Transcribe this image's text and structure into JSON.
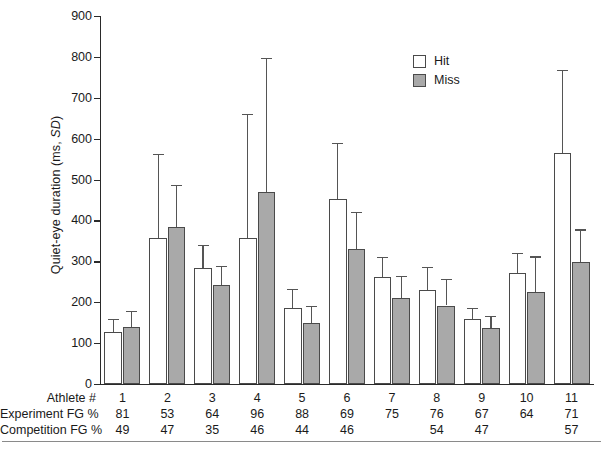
{
  "chart_data": {
    "type": "bar",
    "title": "",
    "xlabel": "Athlete #",
    "ylabel": "Quiet-eye duration (ms, SD)",
    "ylim": [
      0,
      900
    ],
    "yticks": [
      0,
      100,
      200,
      300,
      400,
      500,
      600,
      700,
      800,
      900
    ],
    "grid": false,
    "legend_position": "top-right",
    "categories": [
      "1",
      "2",
      "3",
      "4",
      "5",
      "6",
      "7",
      "8",
      "9",
      "10",
      "11"
    ],
    "series": [
      {
        "name": "Hit",
        "color": "#ffffff",
        "values": [
          127,
          358,
          283,
          357,
          187,
          452,
          261,
          229,
          158,
          271,
          565
        ],
        "error_upper": [
          160,
          563,
          340,
          660,
          232,
          590,
          310,
          287,
          187,
          320,
          768
        ]
      },
      {
        "name": "Miss",
        "color": "#a9a9a9",
        "values": [
          139,
          385,
          241,
          469,
          150,
          330,
          211,
          192,
          137,
          224,
          298
        ],
        "error_upper": [
          178,
          487,
          289,
          798,
          190,
          420,
          265,
          258,
          167,
          312,
          378
        ]
      }
    ]
  },
  "legend": {
    "items": [
      {
        "label": "Hit",
        "swatch": "white"
      },
      {
        "label": "Miss",
        "swatch": "gray"
      }
    ]
  },
  "axis": {
    "y_title_main": "Quiet-eye duration (ms, ",
    "y_title_italic": "SD",
    "y_title_close": ")",
    "y_tick_labels": [
      "900",
      "800",
      "700",
      "600",
      "500",
      "400",
      "300",
      "200",
      "100",
      "0"
    ]
  },
  "table": {
    "rows": [
      {
        "header": "Athlete #",
        "values": [
          "1",
          "2",
          "3",
          "4",
          "5",
          "6",
          "7",
          "8",
          "9",
          "10",
          "11"
        ]
      },
      {
        "header": "Experiment FG %",
        "values": [
          "81",
          "53",
          "64",
          "96",
          "88",
          "69",
          "75",
          "76",
          "67",
          "64",
          "71"
        ]
      },
      {
        "header": "Competition FG %",
        "values": [
          "49",
          "47",
          "35",
          "46",
          "44",
          "46",
          "",
          "54",
          "47",
          "",
          "57"
        ]
      }
    ]
  },
  "colors": {
    "hit_fill": "#ffffff",
    "miss_fill": "#a9a9a9",
    "bar_stroke": "#4a4a4a",
    "axis": "#2a2a2a",
    "error_bar": "#555555",
    "text": "#1a1a1a",
    "rule": "#8a8a8a"
  }
}
